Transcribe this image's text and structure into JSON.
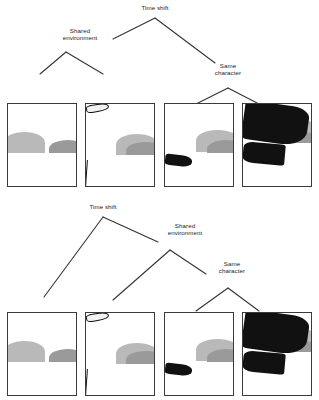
{
  "figure": {
    "background_color": "#ffffff",
    "ink_color": "#111111",
    "line_color": "#333333"
  },
  "diagrams": [
    {
      "id": "top-diagram",
      "name": "balanced-binary-tree",
      "nodes": [
        {
          "id": "time-shift",
          "label": "Time shift",
          "x": 155,
          "y": 10
        },
        {
          "id": "shared-environment",
          "label": "Shared\nenvironment",
          "x": 80,
          "y": 33
        },
        {
          "id": "same-character",
          "label": "Same\ncharacter",
          "x": 228,
          "y": 68
        }
      ],
      "edges": [
        {
          "from": "time-shift",
          "to": "shared-environment",
          "points": "155,18 113,39"
        },
        {
          "from": "time-shift",
          "to": "same-character",
          "points": "155,18 215,63"
        },
        {
          "from": "shared-environment",
          "to": "panel-1",
          "points": "66,52 40,74"
        },
        {
          "from": "shared-environment",
          "to": "panel-2",
          "points": "66,52 103,74"
        },
        {
          "from": "same-character",
          "to": "panel-3",
          "points": "228,88 196,104"
        },
        {
          "from": "same-character",
          "to": "panel-4",
          "points": "228,88 259,104"
        }
      ],
      "panels": [
        {
          "id": "panel-1",
          "name": "panel-man-sunglasses-neck",
          "alt": "Man with dark sunglasses and slicked hair, hand raised to his neck, hills in background"
        },
        {
          "id": "panel-2",
          "name": "panel-girl-pointing",
          "alt": "Girl with bob haircut and bangs, arm outstretched pointing to the right, hills in background"
        },
        {
          "id": "panel-3",
          "name": "panel-man-arm-extended",
          "alt": "Man with sunglasses in dark jacket, arm extended forward across the frame"
        },
        {
          "id": "panel-4",
          "name": "panel-hands-closeup-watch",
          "alt": "Close-up of two hands in dark sleeves meeting, wristwatch visible"
        }
      ]
    },
    {
      "id": "bottom-diagram",
      "name": "right-branching-tree",
      "nodes": [
        {
          "id": "time-shift",
          "label": "Time shift",
          "x": 103,
          "y": 209
        },
        {
          "id": "shared-environment",
          "label": "Shared\nenvironment",
          "x": 185,
          "y": 228
        },
        {
          "id": "same-character",
          "label": "Same\ncharacter",
          "x": 232,
          "y": 266
        }
      ],
      "edges": [
        {
          "from": "time-shift",
          "to": "panel-1",
          "points": "103,217 44,297"
        },
        {
          "from": "time-shift",
          "to": "shared-environment",
          "points": "103,217 158,242"
        },
        {
          "from": "shared-environment",
          "to": "panel-2",
          "points": "170,250 113,300"
        },
        {
          "from": "shared-environment",
          "to": "same-character",
          "points": "170,250 206,274"
        },
        {
          "from": "same-character",
          "to": "panel-3",
          "points": "228,288 196,311"
        },
        {
          "from": "same-character",
          "to": "panel-4",
          "points": "228,288 259,311"
        }
      ],
      "panels": [
        {
          "id": "panel-1",
          "name": "panel-man-sunglasses-neck",
          "alt": "Man with dark sunglasses and slicked hair, hand raised to his neck, hills in background"
        },
        {
          "id": "panel-2",
          "name": "panel-girl-pointing",
          "alt": "Girl with bob haircut and bangs, arm outstretched pointing to the right, hills in background"
        },
        {
          "id": "panel-3",
          "name": "panel-man-arm-extended",
          "alt": "Man with sunglasses in dark jacket, arm extended forward across the frame"
        },
        {
          "id": "panel-4",
          "name": "panel-hands-closeup-watch",
          "alt": "Close-up of two hands in dark sleeves meeting, wristwatch visible"
        }
      ]
    }
  ]
}
